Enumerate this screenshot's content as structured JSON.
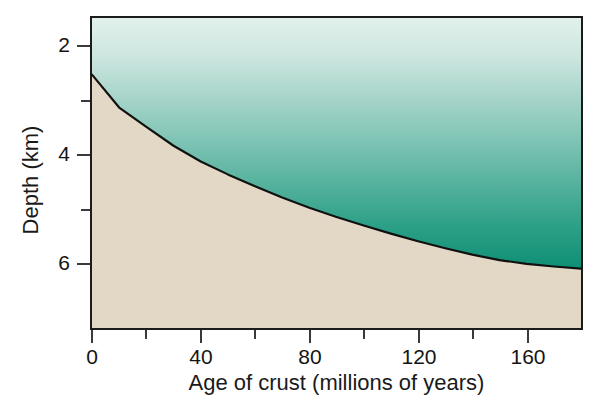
{
  "chart_data": {
    "type": "area",
    "title": "",
    "xlabel": "Age of crust (millions of years)",
    "ylabel": "Depth (km)",
    "xlim": [
      0,
      180
    ],
    "ylim": [
      1.45,
      7.2
    ],
    "y_inverted": true,
    "grid": false,
    "legend": null,
    "xticks_major": [
      0,
      40,
      80,
      120,
      160
    ],
    "xticks_minor": [
      20,
      60,
      100,
      140
    ],
    "xtick_labels": [
      "0",
      "40",
      "80",
      "120",
      "160"
    ],
    "yticks_major": [
      2,
      4,
      6
    ],
    "yticks_minor": [
      3,
      5
    ],
    "ytick_labels": [
      "2",
      "4",
      "6"
    ],
    "series": [
      {
        "name": "Ocean floor depth",
        "relation": "depth = 2.5 + 0.35 * sqrt(age)",
        "x": [
          0,
          10,
          20,
          30,
          40,
          50,
          60,
          70,
          80,
          90,
          100,
          110,
          120,
          130,
          140,
          150,
          160,
          170,
          180
        ],
        "y": [
          2.5,
          3.11,
          3.47,
          3.82,
          4.11,
          4.35,
          4.57,
          4.78,
          4.97,
          5.14,
          5.3,
          5.45,
          5.59,
          5.72,
          5.84,
          5.94,
          6.01,
          6.06,
          6.1
        ]
      }
    ],
    "regions": [
      {
        "name": "seawater",
        "fill": "gradient",
        "color_top": "#dff0ea",
        "color_bottom": "#14947a"
      },
      {
        "name": "oceanic-crust",
        "fill": "solid",
        "color": "#e3d8c5"
      }
    ],
    "colors": {
      "water_top": "#dff0ea",
      "water_mid": "#79c2b4",
      "water_bottom": "#14947a",
      "crust": "#e3d8c5",
      "curve": "#111111",
      "frame": "#1b1b1b",
      "text": "#141414",
      "background": "#ffffff"
    }
  }
}
